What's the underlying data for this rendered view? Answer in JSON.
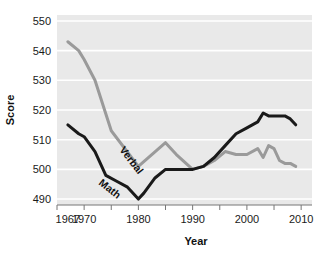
{
  "chart_data": {
    "type": "line",
    "title": "",
    "xlabel": "Year",
    "ylabel": "Score",
    "xlim": [
      1965,
      2012
    ],
    "ylim": [
      488,
      552
    ],
    "grid": true,
    "grid_color": "#ffffff",
    "plot_background": "#e9e9e9",
    "legend_position": "inline-labels",
    "y_ticks": [
      490,
      500,
      510,
      520,
      530,
      540,
      550
    ],
    "y_tick_labels": [
      "490",
      "500",
      "510",
      "520",
      "530",
      "540",
      "550"
    ],
    "x_ticks": [
      1967,
      1970,
      1980,
      1990,
      2000,
      2010
    ],
    "x_tick_labels": [
      "1967",
      "1970",
      "1980",
      "1990",
      "2000",
      "2010"
    ],
    "x_minor_ticks": [
      1965,
      1970,
      1975,
      1980,
      1985,
      1990,
      1995,
      2000,
      2005,
      2010
    ],
    "series": [
      {
        "name": "Verbal",
        "color": "#9a9a9a",
        "label_text": "Verbal",
        "x": [
          1967,
          1969,
          1970,
          1972,
          1975,
          1980,
          1985,
          1987,
          1990,
          1992,
          1994,
          1996,
          1998,
          2000,
          2002,
          2003,
          2004,
          2005,
          2006,
          2007,
          2008,
          2009
        ],
        "values": [
          543,
          540,
          537,
          530,
          513,
          501,
          509,
          505,
          500,
          501,
          503,
          506,
          505,
          505,
          507,
          504,
          508,
          507,
          503,
          502,
          502,
          501
        ]
      },
      {
        "name": "Math",
        "color": "#1a1a1a",
        "label_text": "Math",
        "x": [
          1967,
          1969,
          1970,
          1972,
          1974,
          1976,
          1978,
          1980,
          1981,
          1983,
          1985,
          1987,
          1990,
          1992,
          1994,
          1996,
          1998,
          2000,
          2002,
          2003,
          2004,
          2005,
          2006,
          2007,
          2008,
          2009
        ],
        "values": [
          515,
          512,
          511,
          506,
          498,
          496,
          494,
          490,
          492,
          497,
          500,
          500,
          500,
          501,
          504,
          508,
          512,
          514,
          516,
          519,
          518,
          518,
          518,
          518,
          517,
          515
        ]
      }
    ]
  },
  "axes": {
    "y_axis_title": "Score",
    "x_axis_title": "Year"
  }
}
